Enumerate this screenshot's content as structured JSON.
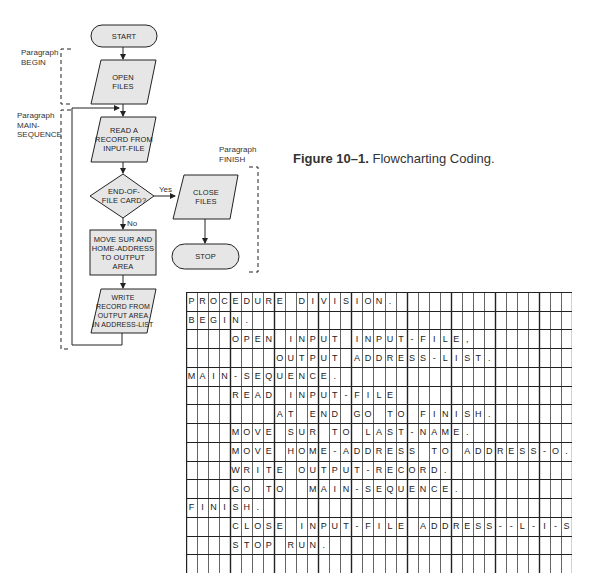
{
  "flowchart": {
    "start": "START",
    "open_files": [
      "OPEN",
      "FILES"
    ],
    "read_record": [
      "READ A",
      "RECORD FROM",
      "INPUT-FILE"
    ],
    "decision": [
      "END-OF-",
      "FILE CARD?"
    ],
    "yes_label": "Yes",
    "no_label": "No",
    "move": [
      "MOVE SUR AND",
      "HOME-ADDRESS",
      "TO OUTPUT AREA"
    ],
    "write": [
      "WRITE",
      "RECORD FROM",
      "OUTPUT AREA",
      "IN ADDRESS-LIST"
    ],
    "close_files": [
      "CLOSE",
      "FILES"
    ],
    "stop": "STOP",
    "paragraphs": {
      "begin": [
        "Paragraph",
        "BEGIN"
      ],
      "main_sequence": [
        "Paragraph",
        "MAIN-",
        "SEQUENCE"
      ],
      "finish": [
        "Paragraph",
        "FINISH"
      ]
    }
  },
  "caption": {
    "label": "Figure 10–1.",
    "text": "Flowcharting Coding."
  },
  "coding_sheet": {
    "columns": 35,
    "rows": [
      "PROCEDURE DIVISION.",
      "BEGIN.",
      "    OPEN INPUT INPUT-FILE,",
      "        OUTPUT ADDRESS-LIST.",
      "MAIN-SEQUENCE.",
      "    READ INPUT-FILE",
      "        AT END GO TO FINISH.",
      "    MOVE SUR TO LAST-NAME.",
      "    MOVE HOME-ADDRESS TO ADDRESS-O.",
      "    WRITE OUTPUT-RECORD.",
      "    GO TO  MAIN-SEQUENCE.",
      "FINISH.",
      "    CLOSE INPUT-FILE ADDRESS--L-I-S-T.",
      "    STOP RUN.",
      ""
    ]
  }
}
